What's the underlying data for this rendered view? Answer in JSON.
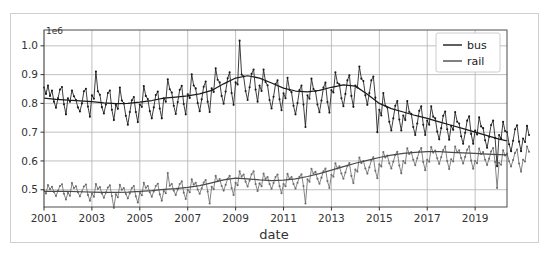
{
  "figure": {
    "width": 550,
    "height": 257,
    "background": "#ffffff",
    "border_color": "#cfcfcf"
  },
  "chart_data": {
    "type": "line",
    "title": "",
    "subtitle": "",
    "xlabel": "date",
    "ylabel": "",
    "y_offset_text": "1e6",
    "y_offset_value": 1000000,
    "grid": true,
    "grid_color": "#b0b0b0",
    "legend_position": "upper right",
    "xlim": [
      2001.0,
      2020.33
    ],
    "ylim": [
      0.44,
      1.055
    ],
    "xticks": [
      2001,
      2003,
      2005,
      2007,
      2009,
      2011,
      2013,
      2015,
      2017,
      2019
    ],
    "xtick_labels": [
      "2001",
      "2003",
      "2005",
      "2007",
      "2009",
      "2011",
      "2013",
      "2015",
      "2017",
      "2019"
    ],
    "yticks": [
      0.5,
      0.6,
      0.7,
      0.8,
      0.9,
      1.0
    ],
    "ytick_labels": [
      "0.5",
      "0.6",
      "0.7",
      "0.8",
      "0.9",
      "1.0"
    ],
    "marker": "point",
    "series": [
      {
        "name": "bus",
        "color": "#1a1a1a",
        "trend_color": "#1a1a1a",
        "x_start": 2001.0,
        "x_step": 0.0833333,
        "values": [
          0.855,
          0.833,
          0.862,
          0.826,
          0.845,
          0.806,
          0.785,
          0.818,
          0.848,
          0.857,
          0.797,
          0.762,
          0.818,
          0.806,
          0.845,
          0.825,
          0.812,
          0.786,
          0.772,
          0.8,
          0.842,
          0.851,
          0.789,
          0.754,
          0.828,
          0.816,
          0.911,
          0.842,
          0.83,
          0.787,
          0.765,
          0.796,
          0.836,
          0.845,
          0.778,
          0.742,
          0.795,
          0.781,
          0.855,
          0.81,
          0.8,
          0.757,
          0.726,
          0.77,
          0.811,
          0.822,
          0.77,
          0.735,
          0.796,
          0.788,
          0.86,
          0.826,
          0.815,
          0.773,
          0.748,
          0.786,
          0.829,
          0.841,
          0.782,
          0.748,
          0.818,
          0.806,
          0.884,
          0.849,
          0.838,
          0.792,
          0.763,
          0.805,
          0.847,
          0.861,
          0.798,
          0.762,
          0.832,
          0.819,
          0.901,
          0.862,
          0.852,
          0.801,
          0.773,
          0.814,
          0.858,
          0.876,
          0.806,
          0.77,
          0.852,
          0.84,
          0.922,
          0.882,
          0.873,
          0.826,
          0.799,
          0.841,
          0.887,
          0.908,
          0.836,
          0.795,
          0.873,
          0.866,
          1.018,
          0.9,
          0.894,
          0.843,
          0.812,
          0.856,
          0.903,
          0.918,
          0.848,
          0.806,
          0.862,
          0.843,
          0.918,
          0.874,
          0.863,
          0.812,
          0.782,
          0.823,
          0.867,
          0.88,
          0.814,
          0.776,
          0.835,
          0.818,
          0.889,
          0.847,
          0.839,
          0.792,
          0.762,
          0.801,
          0.846,
          0.862,
          0.796,
          0.718,
          0.828,
          0.816,
          0.886,
          0.85,
          0.842,
          0.796,
          0.769,
          0.81,
          0.855,
          0.872,
          0.805,
          0.768,
          0.846,
          0.838,
          0.908,
          0.871,
          0.866,
          0.818,
          0.79,
          0.833,
          0.88,
          0.898,
          0.826,
          0.788,
          0.862,
          0.855,
          0.928,
          0.886,
          0.878,
          0.828,
          0.795,
          0.836,
          0.88,
          0.893,
          0.82,
          0.7,
          0.778,
          0.758,
          0.836,
          0.792,
          0.786,
          0.736,
          0.706,
          0.748,
          0.792,
          0.808,
          0.744,
          0.706,
          0.758,
          0.742,
          0.808,
          0.77,
          0.764,
          0.718,
          0.69,
          0.73,
          0.774,
          0.79,
          0.726,
          0.69,
          0.74,
          0.726,
          0.79,
          0.754,
          0.748,
          0.702,
          0.675,
          0.714,
          0.757,
          0.772,
          0.71,
          0.674,
          0.722,
          0.708,
          0.77,
          0.736,
          0.73,
          0.686,
          0.66,
          0.698,
          0.74,
          0.755,
          0.694,
          0.66,
          0.706,
          0.692,
          0.752,
          0.72,
          0.714,
          0.672,
          0.646,
          0.684,
          0.725,
          0.74,
          0.68,
          0.582,
          0.69,
          0.678,
          0.736,
          0.704,
          0.7,
          0.658,
          0.634,
          0.67,
          0.71,
          0.724,
          0.667,
          0.634,
          0.678,
          0.666,
          0.722,
          0.69
        ]
      },
      {
        "name": "rail",
        "color": "#6e6e6e",
        "trend_color": "#4a4a4a",
        "x_start": 2001.0,
        "x_step": 0.0833333,
        "values": [
          0.498,
          0.487,
          0.516,
          0.502,
          0.51,
          0.492,
          0.478,
          0.496,
          0.513,
          0.519,
          0.486,
          0.466,
          0.489,
          0.479,
          0.523,
          0.506,
          0.512,
          0.491,
          0.477,
          0.494,
          0.511,
          0.518,
          0.482,
          0.462,
          0.486,
          0.476,
          0.52,
          0.503,
          0.509,
          0.487,
          0.472,
          0.49,
          0.508,
          0.515,
          0.478,
          0.437,
          0.484,
          0.474,
          0.517,
          0.5,
          0.506,
          0.485,
          0.47,
          0.488,
          0.506,
          0.513,
          0.477,
          0.456,
          0.49,
          0.481,
          0.524,
          0.507,
          0.513,
          0.491,
          0.476,
          0.494,
          0.513,
          0.521,
          0.484,
          0.462,
          0.496,
          0.488,
          0.558,
          0.514,
          0.52,
          0.497,
          0.482,
          0.501,
          0.52,
          0.529,
          0.49,
          0.468,
          0.5,
          0.491,
          0.536,
          0.518,
          0.524,
          0.501,
          0.486,
          0.505,
          0.525,
          0.534,
          0.494,
          0.452,
          0.51,
          0.502,
          0.548,
          0.53,
          0.537,
          0.513,
          0.497,
          0.517,
          0.538,
          0.548,
          0.506,
          0.482,
          0.524,
          0.516,
          0.564,
          0.546,
          0.553,
          0.528,
          0.511,
          0.532,
          0.554,
          0.564,
          0.52,
          0.496,
          0.522,
          0.512,
          0.556,
          0.538,
          0.544,
          0.52,
          0.503,
          0.523,
          0.544,
          0.553,
          0.512,
          0.488,
          0.52,
          0.512,
          0.555,
          0.538,
          0.544,
          0.52,
          0.504,
          0.524,
          0.545,
          0.554,
          0.513,
          0.452,
          0.536,
          0.528,
          0.573,
          0.556,
          0.562,
          0.538,
          0.521,
          0.542,
          0.564,
          0.574,
          0.53,
          0.506,
          0.552,
          0.545,
          0.592,
          0.574,
          0.581,
          0.556,
          0.538,
          0.56,
          0.583,
          0.593,
          0.548,
          0.523,
          0.57,
          0.563,
          0.612,
          0.593,
          0.6,
          0.574,
          0.556,
          0.578,
          0.602,
          0.613,
          0.566,
          0.54,
          0.588,
          0.581,
          0.631,
          0.612,
          0.619,
          0.592,
          0.574,
          0.597,
          0.621,
          0.632,
          0.584,
          0.557,
          0.6,
          0.592,
          0.644,
          0.624,
          0.631,
          0.604,
          0.585,
          0.609,
          0.633,
          0.645,
          0.596,
          0.568,
          0.604,
          0.597,
          0.648,
          0.629,
          0.636,
          0.609,
          0.59,
          0.613,
          0.638,
          0.65,
          0.6,
          0.572,
          0.606,
          0.598,
          0.65,
          0.63,
          0.637,
          0.61,
          0.591,
          0.614,
          0.639,
          0.651,
          0.601,
          0.573,
          0.6,
          0.592,
          0.643,
          0.624,
          0.631,
          0.604,
          0.586,
          0.608,
          0.633,
          0.645,
          0.596,
          0.506,
          0.594,
          0.587,
          0.637,
          0.619,
          0.626,
          0.599,
          0.581,
          0.603,
          0.628,
          0.64,
          0.591,
          0.563,
          0.604,
          0.598,
          0.65,
          0.632
        ]
      }
    ],
    "trend_series": [
      {
        "name": "bus-trend",
        "color": "#1a1a1a",
        "x": [
          2001.0,
          2001.5,
          2002.0,
          2002.5,
          2003.0,
          2003.5,
          2004.0,
          2004.5,
          2005.0,
          2005.5,
          2006.0,
          2006.5,
          2007.0,
          2007.5,
          2008.0,
          2008.5,
          2009.0,
          2009.5,
          2010.0,
          2010.5,
          2011.0,
          2011.5,
          2012.0,
          2012.5,
          2013.0,
          2013.5,
          2014.0,
          2014.5,
          2015.0,
          2015.5,
          2016.0,
          2016.5,
          2017.0,
          2017.5,
          2018.0,
          2018.5,
          2019.0,
          2019.5,
          2020.0,
          2020.33
        ],
        "values": [
          0.818,
          0.814,
          0.811,
          0.809,
          0.806,
          0.802,
          0.799,
          0.8,
          0.804,
          0.81,
          0.818,
          0.822,
          0.826,
          0.833,
          0.845,
          0.868,
          0.888,
          0.896,
          0.888,
          0.871,
          0.853,
          0.843,
          0.84,
          0.845,
          0.856,
          0.864,
          0.86,
          0.832,
          0.8,
          0.782,
          0.77,
          0.758,
          0.748,
          0.736,
          0.724,
          0.712,
          0.7,
          0.688,
          0.676,
          0.67
        ]
      },
      {
        "name": "rail-trend",
        "color": "#4a4a4a",
        "x": [
          2001.0,
          2001.5,
          2002.0,
          2002.5,
          2003.0,
          2003.5,
          2004.0,
          2004.5,
          2005.0,
          2005.5,
          2006.0,
          2006.5,
          2007.0,
          2007.5,
          2008.0,
          2008.5,
          2009.0,
          2009.5,
          2010.0,
          2010.5,
          2011.0,
          2011.5,
          2012.0,
          2012.5,
          2013.0,
          2013.5,
          2014.0,
          2014.5,
          2015.0,
          2015.5,
          2016.0,
          2016.5,
          2017.0,
          2017.5,
          2018.0,
          2018.5,
          2019.0,
          2019.5,
          2020.0,
          2020.33
        ],
        "values": [
          0.494,
          0.494,
          0.494,
          0.493,
          0.492,
          0.491,
          0.491,
          0.492,
          0.494,
          0.497,
          0.501,
          0.504,
          0.508,
          0.514,
          0.524,
          0.534,
          0.54,
          0.538,
          0.534,
          0.532,
          0.533,
          0.538,
          0.546,
          0.556,
          0.568,
          0.58,
          0.592,
          0.602,
          0.612,
          0.62,
          0.626,
          0.63,
          0.632,
          0.632,
          0.63,
          0.628,
          0.626,
          0.624,
          0.622,
          0.621
        ]
      }
    ]
  },
  "legend": {
    "entries": [
      {
        "label": "bus",
        "color": "#1a1a1a"
      },
      {
        "label": "rail",
        "color": "#4a4a4a"
      }
    ],
    "background": "#ffffff",
    "border_color": "#cccccc"
  },
  "axes": {
    "x_title": "date",
    "y_offset": "1e6",
    "spine_color": "#333333"
  }
}
